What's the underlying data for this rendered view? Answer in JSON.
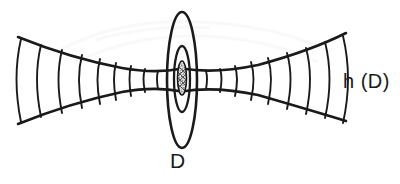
{
  "figure": {
    "background_color": "#ffffff",
    "ink_color": "#1a1a1a",
    "stroke_width": 2.0
  },
  "labels": {
    "disk": "D",
    "surface": "h (D)"
  },
  "geometry": {
    "canvas": {
      "width": 400,
      "height": 184
    },
    "axis_y": 78,
    "center_x": 182,
    "envelope": {
      "left_x": 18,
      "right_x": 346,
      "left_top_y": 37,
      "left_bottom_y": 124,
      "right_top_y": 33,
      "right_bottom_y": 121,
      "waist_half_height": 10
    },
    "cross_section_count_left": 9,
    "cross_section_count_right": 9,
    "outer_ellipse": {
      "cx": 182,
      "cy": 80,
      "rx": 15,
      "ry": 68
    },
    "middle_ellipse": {
      "cx": 182,
      "cy": 79,
      "rx": 8,
      "ry": 33
    },
    "core_ellipse": {
      "cx": 182,
      "cy": 78,
      "rx": 4.5,
      "ry": 17
    }
  },
  "colors": {
    "ink": "#1a1a1a",
    "paper": "#ffffff",
    "hatch": "#2a2a2a"
  }
}
